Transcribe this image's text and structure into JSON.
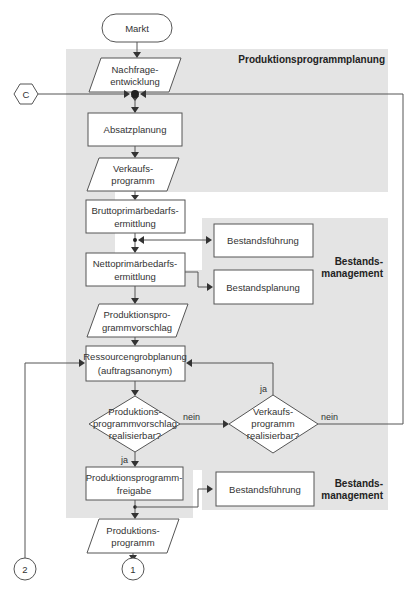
{
  "diagram": {
    "regions": {
      "production_planning": {
        "title": "Produktionsprogrammplanung"
      },
      "inventory_mgmt_1": {
        "title_line1": "Bestands-",
        "title_line2": "management"
      },
      "inventory_mgmt_2": {
        "title_line1": "Bestands-",
        "title_line2": "management"
      }
    },
    "nodes": {
      "markt": {
        "label": "Markt"
      },
      "nachfrage": {
        "line1": "Nachfrage-",
        "line2": "entwicklung"
      },
      "absatzplanung": {
        "label": "Absatzplanung"
      },
      "verkaufsprogramm": {
        "line1": "Verkaufs-",
        "line2": "programm"
      },
      "brutto": {
        "line1": "Bruttoprimärbedarfs-",
        "line2": "ermittlung"
      },
      "netto": {
        "line1": "Nettoprimärbedarfs-",
        "line2": "ermittlung"
      },
      "bestandsfuehrung_1": {
        "label": "Bestandsführung"
      },
      "bestandsplanung": {
        "label": "Bestandsplanung"
      },
      "vorschlag": {
        "line1": "Produktionspro-",
        "line2": "grammvorschlag"
      },
      "ressourcen": {
        "line1": "Ressourcengrobplanung",
        "line2": "(auftragsanonym)"
      },
      "decision_vorschlag": {
        "line1": "Produktions-",
        "line2": "programmvorschlag",
        "line3": "realisierbar?"
      },
      "decision_verkauf": {
        "line1": "Verkaufs-",
        "line2": "programm",
        "line3": "realisierbar?"
      },
      "freigabe": {
        "line1": "Produktionsprogramm-",
        "line2": "freigabe"
      },
      "bestandsfuehrung_2": {
        "label": "Bestandsführung"
      },
      "produktionsprogramm": {
        "line1": "Produktions-",
        "line2": "programm"
      }
    },
    "connectors": {
      "c": {
        "label": "C"
      },
      "one": {
        "label": "1"
      },
      "two": {
        "label": "2"
      }
    },
    "edge_labels": {
      "vorschlag_nein": "nein",
      "vorschlag_ja": "ja",
      "verkauf_ja": "ja",
      "verkauf_nein": "nein"
    }
  }
}
